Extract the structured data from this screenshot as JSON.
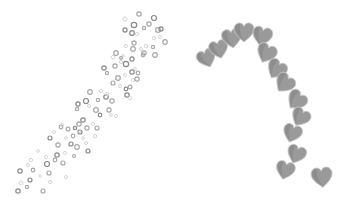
{
  "image": {
    "width": 348,
    "height": 210,
    "background": "#ffffff",
    "description": "Decorative grayscale clip art: a diagonal trail of small rings and a curving trail of overlapping hearts"
  },
  "colors": {
    "ring_dark": "#8a8a8a",
    "ring_mid": "#a8a8a8",
    "ring_light": "#d0d0d0",
    "heart_fill": "#9a9a9a",
    "heart_shadow": "#7f7f7f",
    "heart_edge": "#c8c8c8"
  },
  "rings": [
    [
      18,
      191,
      2.2,
      0
    ],
    [
      27,
      187,
      1.6,
      1
    ],
    [
      21,
      183,
      2,
      2
    ],
    [
      30,
      180,
      2,
      0
    ],
    [
      43,
      191,
      2,
      1
    ],
    [
      50,
      182,
      1.6,
      2
    ],
    [
      33,
      170,
      1.8,
      1
    ],
    [
      20,
      171,
      2.2,
      0
    ],
    [
      28,
      165,
      1.5,
      2
    ],
    [
      47,
      164,
      2.5,
      0
    ],
    [
      49,
      173,
      2,
      1
    ],
    [
      40,
      176,
      1.3,
      2
    ],
    [
      55,
      160,
      1.8,
      1
    ],
    [
      46,
      157,
      1.6,
      2
    ],
    [
      57,
      155,
      2.2,
      0
    ],
    [
      31,
      160,
      1.7,
      2
    ],
    [
      63,
      163,
      2,
      1
    ],
    [
      65,
      153,
      1.6,
      2
    ],
    [
      71,
      144,
      2,
      0
    ],
    [
      58,
      145,
      2.1,
      1
    ],
    [
      77,
      147,
      2.3,
      1
    ],
    [
      73,
      136,
      1.8,
      1
    ],
    [
      80,
      132,
      2,
      0
    ],
    [
      83,
      138,
      1.4,
      2
    ],
    [
      87,
      128,
      2.1,
      1
    ],
    [
      83,
      120,
      2.2,
      0
    ],
    [
      79,
      131,
      1.7,
      2
    ],
    [
      74,
      156,
      1.5,
      1
    ],
    [
      88,
      151,
      2,
      0
    ],
    [
      66,
      138,
      1.4,
      2
    ],
    [
      61,
      127,
      1.8,
      1
    ],
    [
      50,
      138,
      2,
      0
    ],
    [
      54,
      132,
      1.5,
      2
    ],
    [
      68,
      129,
      1.9,
      1
    ],
    [
      62,
      125,
      1.6,
      2
    ],
    [
      79,
      124,
      2.2,
      1
    ],
    [
      75,
      128,
      1.6,
      0
    ],
    [
      86,
      143,
      1.6,
      2
    ],
    [
      97,
      128,
      2,
      1
    ],
    [
      93,
      124,
      1.6,
      2
    ],
    [
      78,
      104,
      2.1,
      0
    ],
    [
      86,
      101,
      2.5,
      0
    ],
    [
      77,
      109,
      1.6,
      1
    ],
    [
      89,
      106,
      1.5,
      2
    ],
    [
      96,
      110,
      2.4,
      1
    ],
    [
      98,
      100,
      1.7,
      1
    ],
    [
      100,
      115,
      1.8,
      0
    ],
    [
      109,
      110,
      2.1,
      1
    ],
    [
      111,
      115,
      1.4,
      2
    ],
    [
      106,
      97,
      2.2,
      0
    ],
    [
      107,
      94,
      1.7,
      2
    ],
    [
      90,
      92,
      2.3,
      1
    ],
    [
      101,
      91,
      1.6,
      2
    ],
    [
      112,
      101,
      2.2,
      1
    ],
    [
      116,
      116,
      1.6,
      2
    ],
    [
      113,
      83,
      2,
      1
    ],
    [
      120,
      86,
      1.5,
      2
    ],
    [
      126,
      89,
      1.8,
      0
    ],
    [
      118,
      78,
      2.3,
      1
    ],
    [
      130,
      87,
      1.9,
      1
    ],
    [
      127,
      95,
      2.2,
      0
    ],
    [
      133,
      80,
      1.7,
      2
    ],
    [
      137,
      79,
      2.1,
      1
    ],
    [
      132,
      72,
      2.2,
      0
    ],
    [
      135,
      69,
      1.4,
      2
    ],
    [
      125,
      75,
      1.5,
      2
    ],
    [
      104,
      68,
      2.2,
      0
    ],
    [
      107,
      73,
      1.6,
      1
    ],
    [
      115,
      66,
      2.1,
      1
    ],
    [
      121,
      62,
      1.6,
      2
    ],
    [
      113,
      57,
      1.7,
      2
    ],
    [
      116,
      53,
      2.3,
      1
    ],
    [
      126,
      64,
      2.6,
      0
    ],
    [
      123,
      56,
      1.4,
      2
    ],
    [
      133,
      49,
      2.3,
      1
    ],
    [
      132,
      59,
      2.1,
      0
    ],
    [
      138,
      73,
      1.8,
      1
    ],
    [
      134,
      43,
      2.1,
      1
    ],
    [
      126,
      46,
      1.6,
      2
    ],
    [
      121,
      58,
      1.4,
      1
    ],
    [
      146,
      46,
      1.7,
      2
    ],
    [
      144,
      53,
      2.2,
      1
    ],
    [
      132,
      33,
      2.3,
      0
    ],
    [
      137,
      34,
      1.6,
      2
    ],
    [
      139,
      14,
      2.2,
      1
    ],
    [
      125,
      19,
      2.1,
      2
    ],
    [
      134,
      25,
      2.7,
      0
    ],
    [
      125,
      30,
      2.1,
      0
    ],
    [
      144,
      28,
      1.6,
      1
    ],
    [
      149,
      24,
      2.1,
      1
    ],
    [
      154,
      18,
      2.5,
      0
    ],
    [
      158,
      30,
      2.4,
      1
    ],
    [
      154,
      38,
      1.6,
      2
    ],
    [
      161,
      29,
      2.1,
      0
    ],
    [
      165,
      42,
      2.3,
      1
    ],
    [
      160,
      37,
      1.5,
      2
    ],
    [
      153,
      47,
      1.6,
      1
    ],
    [
      155,
      55,
      2.3,
      1
    ],
    [
      141,
      49,
      1.5,
      2
    ],
    [
      143,
      55,
      1.8,
      1
    ],
    [
      130,
      98,
      1.6,
      2
    ],
    [
      95,
      136,
      1.6,
      2
    ],
    [
      66,
      177,
      1.5,
      2
    ],
    [
      38,
      151,
      1.4,
      2
    ]
  ],
  "hearts": [
    {
      "x": 207,
      "y": 59,
      "size": 19,
      "rot": -22
    },
    {
      "x": 219,
      "y": 50,
      "size": 19,
      "rot": -14
    },
    {
      "x": 232,
      "y": 39,
      "size": 20,
      "rot": -8
    },
    {
      "x": 244,
      "y": 33,
      "size": 20,
      "rot": 0
    },
    {
      "x": 262,
      "y": 37,
      "size": 20,
      "rot": 12
    },
    {
      "x": 266,
      "y": 54,
      "size": 20,
      "rot": 24
    },
    {
      "x": 276,
      "y": 70,
      "size": 20,
      "rot": 32
    },
    {
      "x": 284,
      "y": 84,
      "size": 20,
      "rot": 38
    },
    {
      "x": 296,
      "y": 101,
      "size": 20,
      "rot": 40
    },
    {
      "x": 300,
      "y": 118,
      "size": 19,
      "rot": 30
    },
    {
      "x": 292,
      "y": 134,
      "size": 19,
      "rot": 18
    },
    {
      "x": 296,
      "y": 155,
      "size": 19,
      "rot": 20
    },
    {
      "x": 285,
      "y": 171,
      "size": 19,
      "rot": 14
    },
    {
      "x": 322,
      "y": 178,
      "size": 21,
      "rot": -6
    }
  ]
}
